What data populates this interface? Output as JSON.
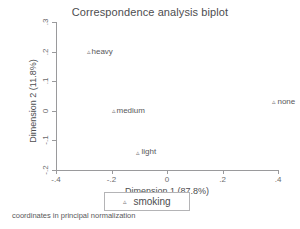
{
  "chart_data": {
    "type": "scatter",
    "title": "Correspondence analysis biplot",
    "xlabel": "Dimension 1 (87.8%)",
    "ylabel": "Dimension 2 (11.8%)",
    "xlim": [
      -0.4,
      0.4
    ],
    "ylim": [
      -0.2,
      0.3
    ],
    "grid": false,
    "xticks": [
      -0.4,
      -0.2,
      0,
      0.2,
      0.4
    ],
    "xticklabels": [
      "-.4",
      "-.2",
      "0",
      ".2",
      ".4"
    ],
    "yticks": [
      -0.2,
      -0.1,
      0,
      0.1,
      0.2,
      0.3
    ],
    "yticklabels": [
      "-.2",
      "-.1",
      "0",
      ".1",
      ".2",
      ".3"
    ],
    "marker": "triangle-small",
    "series": [
      {
        "name": "smoking",
        "points": [
          {
            "label": "heavy",
            "x": -0.29,
            "y": 0.2
          },
          {
            "label": "medium",
            "x": -0.2,
            "y": 0.0
          },
          {
            "label": "light",
            "x": -0.11,
            "y": -0.14
          },
          {
            "label": "none",
            "x": 0.38,
            "y": 0.03
          }
        ]
      }
    ],
    "legend": {
      "position": "bottom-center",
      "entries": [
        "smoking"
      ]
    },
    "annotations": [
      "coordinates in principal normalization"
    ]
  },
  "legend": {
    "label": "smoking",
    "marker": "triangle-marker"
  },
  "footnote": {
    "text": "coordinates in principal normalization"
  },
  "colors": {
    "marker": "#7d7d80",
    "axis": "#9a9a9c",
    "text": "#4d4d4f",
    "background": "#ffffff"
  }
}
